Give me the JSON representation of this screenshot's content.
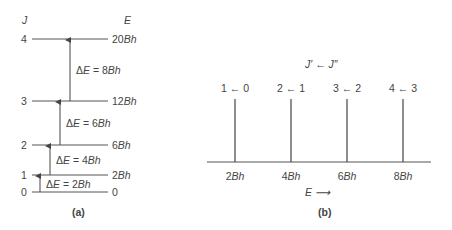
{
  "panel_a": {
    "caption": "(a)",
    "col_j": "J",
    "col_e": "E",
    "levels": [
      {
        "j": "0",
        "e": "0",
        "y": 192
      },
      {
        "j": "1",
        "e": "2Bh",
        "y": 175
      },
      {
        "j": "2",
        "e": "6Bh",
        "y": 145
      },
      {
        "j": "3",
        "e": "12Bh",
        "y": 101
      },
      {
        "j": "4",
        "e": "20Bh",
        "y": 39
      }
    ],
    "transitions": [
      {
        "label": "ΔE = 2Bh",
        "x": 40,
        "from": 192,
        "to": 175
      },
      {
        "label": "ΔE = 4Bh",
        "x": 50,
        "from": 175,
        "to": 145
      },
      {
        "label": "ΔE = 6Bh",
        "x": 60,
        "from": 145,
        "to": 101
      },
      {
        "label": "ΔE = 8Bh",
        "x": 70,
        "from": 101,
        "to": 39
      }
    ]
  },
  "panel_b": {
    "caption": "(b)",
    "header": "J′ ← J″",
    "axis_label": "E ⟶",
    "lines": [
      {
        "label": "1 ← 0",
        "tick": "2Bh",
        "x": 235
      },
      {
        "label": "2 ← 1",
        "tick": "4Bh",
        "x": 291
      },
      {
        "label": "3 ← 2",
        "tick": "6Bh",
        "x": 347
      },
      {
        "label": "4 ← 3",
        "tick": "8Bh",
        "x": 403
      }
    ]
  }
}
